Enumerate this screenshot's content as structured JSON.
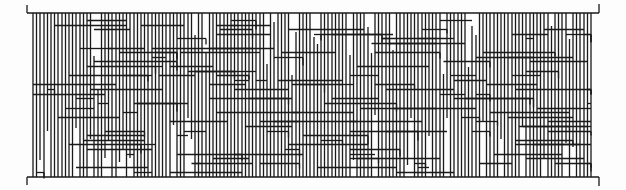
{
  "figure": {
    "type": "ladder-network-diagram",
    "description": "Dense line diagram of vertical strands between a top bar and a bottom bar, connected by many horizontal rungs",
    "stroke_color": "#1a1a1a",
    "background": "#fdfdfd",
    "stroke_width": 1.3,
    "frame": {
      "left_x": 27,
      "right_x": 599,
      "top_y": 13,
      "bottom_y": 177,
      "top_left_tick": [
        27,
        5,
        27,
        13
      ],
      "top_right_tick": [
        599,
        4,
        599,
        13
      ],
      "bottom_left_tick": [
        27,
        177,
        27,
        185
      ],
      "bottom_right_tick": [
        599,
        177,
        599,
        186
      ]
    },
    "strands": {
      "x_start": 33,
      "x_end": 592,
      "spacing": 3.6,
      "count": 156
    },
    "rungs": {
      "rows": 34,
      "y_start": 20,
      "y_end": 172,
      "per_row_min": 3,
      "per_row_max": 7,
      "seed": 1337
    }
  }
}
